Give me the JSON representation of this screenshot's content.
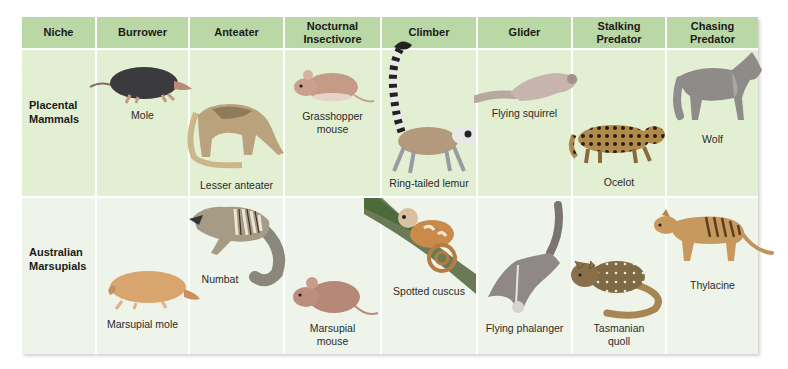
{
  "header": {
    "niche": "Niche",
    "columns": [
      "Burrower",
      "Anteater",
      "Nocturnal Insectivore",
      "Climber",
      "Glider",
      "Stalking Predator",
      "Chasing Predator"
    ],
    "columns_split": [
      [
        "Burrower"
      ],
      [
        "Anteater"
      ],
      [
        "Nocturnal",
        "Insectivore"
      ],
      [
        "Climber"
      ],
      [
        "Glider"
      ],
      [
        "Stalking",
        "Predator"
      ],
      [
        "Chasing",
        "Predator"
      ]
    ]
  },
  "rows": [
    {
      "label": [
        "Placental",
        "Mammals"
      ],
      "animals": [
        {
          "name": [
            "Mole"
          ],
          "icon": "mole-icon"
        },
        {
          "name": [
            "Lesser anteater"
          ],
          "icon": "lesser-anteater-icon"
        },
        {
          "name": [
            "Grasshopper",
            "mouse"
          ],
          "icon": "grasshopper-mouse-icon"
        },
        {
          "name": [
            "Ring-tailed lemur"
          ],
          "icon": "ring-tailed-lemur-icon"
        },
        {
          "name": [
            "Flying squirrel"
          ],
          "icon": "flying-squirrel-icon"
        },
        {
          "name": [
            "Ocelot"
          ],
          "icon": "ocelot-icon"
        },
        {
          "name": [
            "Wolf"
          ],
          "icon": "wolf-icon"
        }
      ]
    },
    {
      "label": [
        "Australian",
        "Marsupials"
      ],
      "animals": [
        {
          "name": [
            "Marsupial mole"
          ],
          "icon": "marsupial-mole-icon"
        },
        {
          "name": [
            "Numbat"
          ],
          "icon": "numbat-icon"
        },
        {
          "name": [
            "Marsupial",
            "mouse"
          ],
          "icon": "marsupial-mouse-icon"
        },
        {
          "name": [
            "Spotted cuscus"
          ],
          "icon": "spotted-cuscus-icon"
        },
        {
          "name": [
            "Flying phalanger"
          ],
          "icon": "flying-phalanger-icon"
        },
        {
          "name": [
            "Tasmanian",
            "quoll"
          ],
          "icon": "tasmanian-quoll-icon"
        },
        {
          "name": [
            "Thylacine"
          ],
          "icon": "thylacine-icon"
        }
      ]
    }
  ],
  "colors": {
    "header_bg": "#b9d8a6",
    "placental_row_bg": "#e3efd3",
    "marsupial_row_bg": "#eef4ea",
    "grid_line": "#ffffff"
  }
}
